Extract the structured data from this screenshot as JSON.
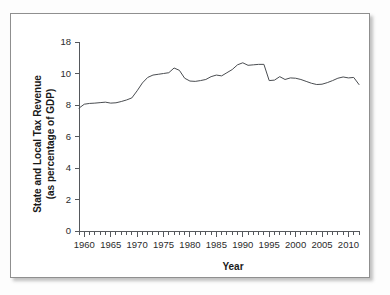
{
  "figure": {
    "background_color": "#ffffff",
    "border_color": "#8f8f8f"
  },
  "chart_data": {
    "type": "line",
    "title": "",
    "xlabel": "Year",
    "ylabel": "State and Local Tax Revenue (as percentage of GDP)",
    "ylabel_line1": "State and Local Tax Revenue",
    "ylabel_line2": "(as percentage of GDP)",
    "grid": false,
    "legend": "none",
    "line_color": "#4a4d51",
    "xlim": [
      1959,
      2012
    ],
    "ylim": [
      0,
      12
    ],
    "ytick_labels": [
      "0",
      "2",
      "4",
      "6",
      "8",
      "10",
      "18"
    ],
    "ytick_values": [
      0,
      2,
      4,
      6,
      8,
      10,
      12
    ],
    "xtick_labels": [
      "1960",
      "1965",
      "1970",
      "1975",
      "1980",
      "1985",
      "1990",
      "1995",
      "2000",
      "2005",
      "2010"
    ],
    "xtick_values": [
      1960,
      1965,
      1970,
      1975,
      1980,
      1985,
      1990,
      1995,
      2000,
      2005,
      2010
    ],
    "xtick_minor_step": 1,
    "series": [
      {
        "name": "State and Local Tax Revenue",
        "x": [
          1959,
          1960,
          1961,
          1962,
          1963,
          1964,
          1965,
          1966,
          1967,
          1968,
          1969,
          1970,
          1971,
          1972,
          1973,
          1974,
          1975,
          1976,
          1977,
          1978,
          1979,
          1980,
          1981,
          1982,
          1983,
          1984,
          1985,
          1986,
          1987,
          1988,
          1989,
          1990,
          1991,
          1992,
          1993,
          1994,
          1995,
          1996,
          1997,
          1998,
          1999,
          2000,
          2001,
          2002,
          2003,
          2004,
          2005,
          2006,
          2007,
          2008,
          2009,
          2010,
          2011,
          2012
        ],
        "values": [
          7.8,
          8.05,
          8.1,
          8.12,
          8.15,
          8.18,
          8.12,
          8.14,
          8.22,
          8.32,
          8.45,
          8.9,
          9.4,
          9.75,
          9.9,
          9.95,
          10.0,
          10.05,
          10.35,
          10.2,
          9.7,
          9.52,
          9.5,
          9.55,
          9.62,
          9.8,
          9.9,
          9.85,
          10.05,
          10.25,
          10.55,
          10.68,
          10.52,
          10.55,
          10.58,
          10.58,
          9.55,
          9.58,
          9.8,
          9.62,
          9.72,
          9.7,
          9.62,
          9.5,
          9.38,
          9.3,
          9.32,
          9.42,
          9.55,
          9.7,
          9.78,
          9.72,
          9.75,
          9.3
        ]
      }
    ]
  }
}
